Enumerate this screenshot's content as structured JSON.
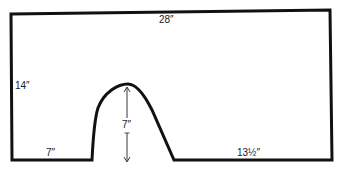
{
  "diagram": {
    "stroke_color": "#111111",
    "background": "#ffffff",
    "labels": {
      "top_width": "28″",
      "left_height": "14″",
      "arch_height": "7″",
      "bottom_left_width": "7″",
      "bottom_right_width": "13½″"
    },
    "dimensions": {
      "total_width_in": 28,
      "total_height_in": 14,
      "arch_height_in": 7,
      "bottom_left_segment_in": 7,
      "bottom_right_segment_in": 13.5
    }
  }
}
